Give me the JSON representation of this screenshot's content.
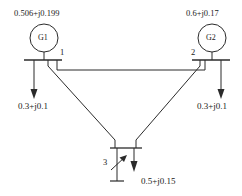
{
  "diagram": {
    "line_color": "#2b2b2b",
    "text_color": "#1a1a1a",
    "generators": [
      {
        "id": "g1",
        "label": "G1",
        "injection": "0.506+j0.199",
        "bus": "1"
      },
      {
        "id": "g2",
        "label": "G2",
        "injection": "0.6+j0.17",
        "bus": "2"
      }
    ],
    "buses": [
      {
        "id": "bus1",
        "number": "1"
      },
      {
        "id": "bus2",
        "number": "2"
      },
      {
        "id": "bus3",
        "number": "3"
      }
    ],
    "loads": [
      {
        "id": "load1",
        "value": "0.3+j0.1",
        "bus": "1"
      },
      {
        "id": "load2",
        "value": "0.3+j0.1",
        "bus": "2"
      },
      {
        "id": "load3",
        "value": "0.5+j0.15",
        "bus": "3"
      }
    ],
    "shunt": {
      "id": "variable-shunt",
      "bus": "3",
      "symbol": "variable-reactor-icon"
    }
  }
}
